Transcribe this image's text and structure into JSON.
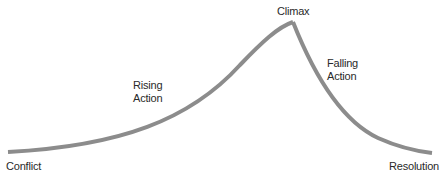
{
  "diagram": {
    "type": "plot-structure-arc",
    "stroke_color": "#8c8c8c",
    "background": "#ffffff",
    "labels": {
      "climax": "Climax",
      "rising_line1": "Rising",
      "rising_line2": "Action",
      "falling_line1": "Falling",
      "falling_line2": "Action",
      "conflict": "Conflict",
      "resolution": "Resolution"
    },
    "stages": [
      "Conflict",
      "Rising Action",
      "Climax",
      "Falling Action",
      "Resolution"
    ]
  }
}
